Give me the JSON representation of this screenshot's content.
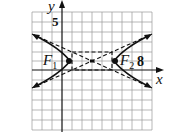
{
  "figure": {
    "type": "hyperbola-graph",
    "axis_labels": {
      "x": "x",
      "y": "y"
    },
    "tick_labels": {
      "y_tick": "5",
      "x_tick": "8"
    },
    "foci": [
      {
        "label": "F",
        "subscript": "1"
      },
      {
        "label": "F",
        "subscript": "2"
      }
    ],
    "grid": {
      "columns": 12,
      "rows": 12
    },
    "elements": [
      "grid",
      "x-axis",
      "y-axis",
      "hyperbola-left-branch",
      "hyperbola-right-branch",
      "asymptotes-dashed",
      "central-rectangle-dashed",
      "focus-points",
      "center-point"
    ],
    "colors": {
      "grid": "#9a9a9a",
      "axes": "#111111",
      "curve": "#111111",
      "background": "#ffffff"
    }
  }
}
